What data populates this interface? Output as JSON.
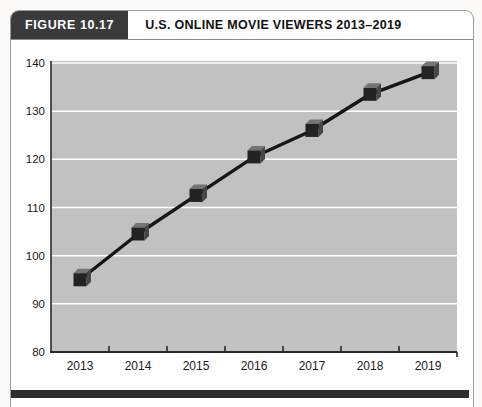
{
  "header": {
    "figure_label": "FIGURE 10.17",
    "title": "U.S. ONLINE MOVIE VIEWERS 2013–2019"
  },
  "chart_data": {
    "type": "line",
    "title": "U.S. ONLINE MOVIE VIEWERS 2013–2019",
    "categories": [
      "2013",
      "2014",
      "2015",
      "2016",
      "2017",
      "2018",
      "2019"
    ],
    "values": [
      95,
      104.5,
      112.5,
      120.5,
      126,
      133.5,
      138
    ],
    "xlabel": "",
    "ylabel": "",
    "ylim": [
      80,
      140
    ],
    "ytick_step": 10,
    "ytick_labels": [
      "80",
      "90",
      "100",
      "110",
      "120",
      "130",
      "140"
    ],
    "grid": "horizontal white gridlines every 10 units on gray plot area",
    "legend": "none",
    "marker_style": "dark 3d cube",
    "line_color": "#161616"
  },
  "colors": {
    "figure_label_bg": "#3a3a3a",
    "figure_label_text": "#ffffff",
    "title_text": "#111111",
    "plot_background": "#c1c1c1",
    "gridline": "#ffffff",
    "axis": "#2a2a2a",
    "tick_label": "#1a1a1a",
    "line": "#161616",
    "cube_front": "#232323",
    "cube_top": "#757575",
    "cube_side": "#464646",
    "bottom_bar": "#2e2e2e",
    "border": "#9b9b9b"
  }
}
